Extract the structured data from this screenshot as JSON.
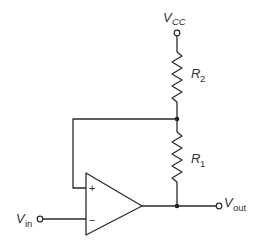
{
  "diagram": {
    "type": "op-amp circuit schematic",
    "colors": {
      "line": "#2a2a2a",
      "text": "#333333",
      "background": "#ffffff"
    },
    "labels": {
      "vcc_main": "V",
      "vcc_sub": "CC",
      "r2_main": "R",
      "r2_sub": "2",
      "r1_main": "R",
      "r1_sub": "1",
      "vin_main": "V",
      "vin_sub": "in",
      "vout_main": "V",
      "vout_sub": "out",
      "opamp_plus": "+",
      "opamp_minus": "−"
    },
    "components": [
      {
        "id": "vcc-terminal",
        "kind": "terminal",
        "label": "VCC"
      },
      {
        "id": "R2",
        "kind": "resistor",
        "label": "R2",
        "between": [
          "VCC",
          "junction-feedback"
        ]
      },
      {
        "id": "R1",
        "kind": "resistor",
        "label": "R1",
        "between": [
          "junction-feedback",
          "output-node"
        ]
      },
      {
        "id": "opamp",
        "kind": "op-amp",
        "inputs": {
          "+": "junction-feedback",
          "-": "Vin"
        },
        "output": "output-node"
      },
      {
        "id": "vin-terminal",
        "kind": "terminal",
        "label": "Vin"
      },
      {
        "id": "vout-terminal",
        "kind": "terminal",
        "label": "Vout"
      }
    ]
  }
}
